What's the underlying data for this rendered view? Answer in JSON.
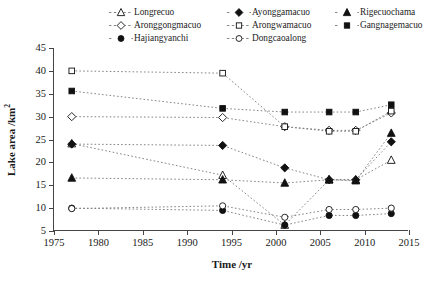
{
  "chart_data": {
    "type": "line",
    "title": "",
    "xlabel": "Time /yr",
    "ylabel": "Lake area /km",
    "ylabel_sup": "2",
    "xlim": [
      1975,
      2015
    ],
    "ylim": [
      5,
      45
    ],
    "xticks": [
      1975,
      1980,
      1985,
      1990,
      1995,
      2000,
      2005,
      2010,
      2015
    ],
    "yticks": [
      5,
      10,
      15,
      20,
      25,
      30,
      35,
      40,
      45
    ],
    "grid": false,
    "legend_position": "top-inside",
    "line_style": "dotted",
    "x": [
      1977,
      1994,
      2001,
      2006,
      2009,
      2013
    ],
    "series": [
      {
        "name": "Longrecuo",
        "marker": "triangle-open",
        "values": [
          24.1,
          17.2,
          6.3,
          16.2,
          16.2,
          20.5
        ]
      },
      {
        "name": "Ayonggamacuo",
        "marker": "diamond-filled",
        "values": [
          24.0,
          23.7,
          18.8,
          16.2,
          16.2,
          24.5
        ]
      },
      {
        "name": "Rigecuochama",
        "marker": "triangle-filled",
        "values": [
          16.6,
          16.2,
          15.5,
          16.2,
          16.0,
          26.4
        ]
      },
      {
        "name": "Aronggongmacuo",
        "marker": "diamond-open",
        "values": [
          30.0,
          29.8,
          27.8,
          27.0,
          27.0,
          30.8
        ]
      },
      {
        "name": "Arongwamacuo",
        "marker": "square-open",
        "values": [
          40.0,
          39.5,
          27.8,
          26.8,
          26.8,
          31.2
        ]
      },
      {
        "name": "Gangnagemacuo",
        "marker": "square-filled",
        "values": [
          35.6,
          31.8,
          31.0,
          31.0,
          31.0,
          32.6
        ]
      },
      {
        "name": "Hajiangyanchi",
        "marker": "circle-filled",
        "values": [
          10.0,
          9.5,
          6.3,
          8.4,
          8.4,
          8.8
        ]
      },
      {
        "name": "Dongcaoalong",
        "marker": "circle-open",
        "values": [
          9.9,
          10.5,
          8.0,
          9.7,
          9.7,
          10.0
        ]
      }
    ]
  },
  "legend": {
    "order": [
      "Longrecuo",
      "Ayonggamacuo",
      "Rigecuochama",
      "Aronggongmacuo",
      "Arongwamacuo",
      "Gangnagemacuo",
      "Hajiangyanchi",
      "Dongcaoalong"
    ]
  },
  "colors": {
    "axis": "#444444",
    "marker_fill": "#111111",
    "marker_open": "#ffffff",
    "line": "#777777"
  }
}
